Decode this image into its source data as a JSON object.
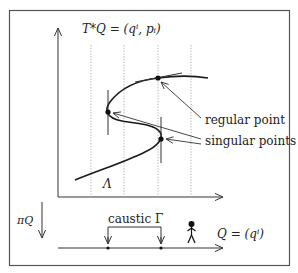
{
  "diagram": {
    "title_label": "T*Q = (qⁱ, pᵢ)",
    "lagrangian_label": "Λ",
    "projection_label": "πQ",
    "caustic_label": "caustic Γ",
    "base_label": "Q = (qⁱ)",
    "annotations": {
      "regular": "regular point",
      "singular": "singular points"
    },
    "colors": {
      "line": "#222222",
      "frame": "#555555",
      "dotted": "#999999"
    }
  }
}
